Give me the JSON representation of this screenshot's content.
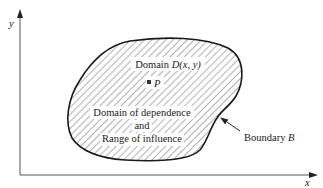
{
  "axes": {
    "x_label": "x",
    "y_label": "y"
  },
  "region": {
    "title_prefix": "Domain ",
    "title_func": "D",
    "title_args": "(x, y)",
    "point_label": "P",
    "desc_line1": "Domain of dependence",
    "desc_line2": "and",
    "desc_line3": "Range of influence"
  },
  "boundary": {
    "label_prefix": "Boundary ",
    "label_var": "B"
  },
  "colors": {
    "stroke": "#1a1a1a",
    "hatch": "#555555",
    "axis": "#555555",
    "background": "#ffffff"
  }
}
